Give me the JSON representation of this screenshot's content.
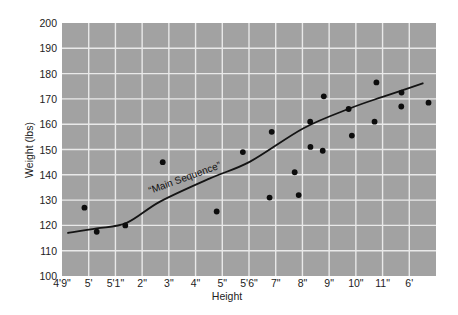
{
  "colors": {
    "plot_background": "#a2a2a2",
    "gridline": "#e9e9e9",
    "curve": "#141414",
    "points": "#0d0d0d"
  },
  "chart_data": {
    "type": "scatter",
    "title": "",
    "xlabel": "Height",
    "ylabel": "Weight (lbs)",
    "ylim": [
      100,
      200
    ],
    "yticks": [
      100,
      110,
      120,
      130,
      140,
      150,
      160,
      170,
      180,
      190,
      200
    ],
    "xticks": [
      "4'9\"",
      "5'",
      "5'1\"",
      "2\"",
      "3\"",
      "4\"",
      "5\"",
      "5'6\"",
      "7\"",
      "8\"",
      "9\"",
      "10\"",
      "11\"",
      "6'"
    ],
    "x_units_note": "x values are positions in tick units (0 = first tick 4'9\", 13 = 6')",
    "xlim": [
      0,
      14
    ],
    "grid": true,
    "legend": null,
    "series": [
      {
        "name": "Individuals",
        "kind": "scatter",
        "points": [
          {
            "x": 0.84,
            "y": 127
          },
          {
            "x": 1.3,
            "y": 117.5
          },
          {
            "x": 2.37,
            "y": 120
          },
          {
            "x": 3.77,
            "y": 145
          },
          {
            "x": 5.79,
            "y": 125.5
          },
          {
            "x": 6.77,
            "y": 149
          },
          {
            "x": 7.77,
            "y": 131
          },
          {
            "x": 7.85,
            "y": 157
          },
          {
            "x": 8.71,
            "y": 141
          },
          {
            "x": 8.86,
            "y": 132
          },
          {
            "x": 9.29,
            "y": 161
          },
          {
            "x": 9.3,
            "y": 151
          },
          {
            "x": 9.76,
            "y": 149.5
          },
          {
            "x": 9.8,
            "y": 171
          },
          {
            "x": 10.73,
            "y": 166
          },
          {
            "x": 10.85,
            "y": 155.5
          },
          {
            "x": 11.7,
            "y": 161
          },
          {
            "x": 11.77,
            "y": 176.5
          },
          {
            "x": 12.7,
            "y": 167
          },
          {
            "x": 12.71,
            "y": 172.5
          },
          {
            "x": 13.72,
            "y": 168.5
          }
        ]
      },
      {
        "name": "Main Sequence",
        "kind": "line",
        "points": [
          {
            "x": 0.2,
            "y": 117
          },
          {
            "x": 1.3,
            "y": 118.8
          },
          {
            "x": 2.42,
            "y": 121
          },
          {
            "x": 3.67,
            "y": 129.4
          },
          {
            "x": 5.54,
            "y": 138.6
          },
          {
            "x": 7.04,
            "y": 145.2
          },
          {
            "x": 9.04,
            "y": 158.4
          },
          {
            "x": 10.79,
            "y": 166.3
          },
          {
            "x": 12.03,
            "y": 170.9
          },
          {
            "x": 13.53,
            "y": 176.2
          }
        ]
      }
    ],
    "annotations": [
      {
        "text": "“Main Sequence”",
        "x": 3.6,
        "y": 137,
        "rotation": -20
      }
    ]
  }
}
